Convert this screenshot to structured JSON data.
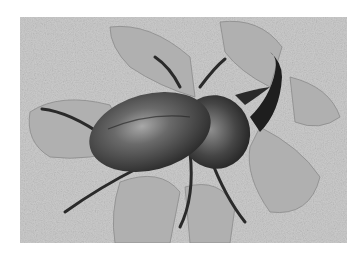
{
  "image": {
    "subject": "rhinoceros beetle on a leaf",
    "style": "grayscale photograph",
    "colors": {
      "background": "#ffffff",
      "ground": "#c9c9c9",
      "leaf": "#b3b3b3",
      "beetle_dark": "#2b2b2b",
      "beetle_highlight": "#9a9a9a"
    }
  }
}
